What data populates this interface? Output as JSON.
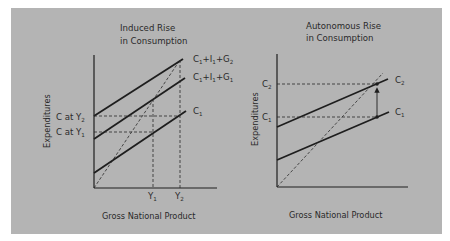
{
  "figure": {
    "background_color": "#b4b4b4",
    "line_color": "#1e1e1e",
    "left_chart": {
      "title_line1": "Induced Rise",
      "title_line2": "in Consumption",
      "ylabel": "Expenditures",
      "xlabel": "Gross National Product",
      "curves": [
        {
          "id": "c1_i1_g2",
          "base": "C",
          "parts": [
            {
              "t": "C",
              "s": "1"
            },
            {
              "t": "+I",
              "s": "1"
            },
            {
              "t": "+G",
              "s": "2"
            }
          ]
        },
        {
          "id": "c1_i1_g1",
          "base": "C",
          "parts": [
            {
              "t": "C",
              "s": "1"
            },
            {
              "t": "+I",
              "s": "1"
            },
            {
              "t": "+G",
              "s": "1"
            }
          ]
        },
        {
          "id": "c1",
          "parts": [
            {
              "t": "C",
              "s": "1"
            }
          ]
        }
      ],
      "y_labels": [
        {
          "text": "C at Y",
          "sub": "2"
        },
        {
          "text": "C at Y",
          "sub": "1"
        }
      ],
      "x_labels": [
        {
          "text": "Y",
          "sub": "1"
        },
        {
          "text": "Y",
          "sub": "2"
        }
      ],
      "guide": "45-degree dashed line"
    },
    "right_chart": {
      "title_line1": "Autonomous Rise",
      "title_line2": "in Consumption",
      "ylabel": "Expenditures",
      "xlabel": "Gross National Product",
      "curves": [
        {
          "id": "c2",
          "parts": [
            {
              "t": "C",
              "s": "2"
            }
          ]
        },
        {
          "id": "c1",
          "parts": [
            {
              "t": "C",
              "s": "1"
            }
          ]
        }
      ],
      "y_labels": [
        {
          "text": "C",
          "sub": "2"
        },
        {
          "text": "C",
          "sub": "1"
        }
      ],
      "annotation": "upward arrow from C1 to C2",
      "guide": "45-degree dashed line"
    }
  }
}
